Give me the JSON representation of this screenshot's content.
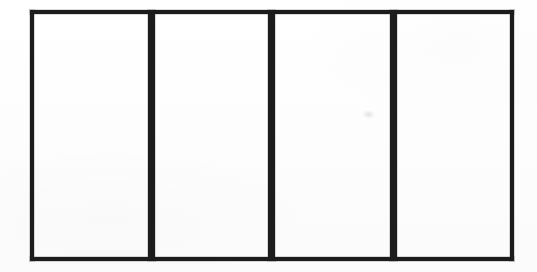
{
  "figure": {
    "kind": "line-drawing",
    "caption": "",
    "width": 537,
    "height": 272,
    "background_color": "#fefefe",
    "ink_color": "#1c1c1c"
  },
  "outline": {
    "label": "outer-rectangle",
    "left": 30,
    "top": 10,
    "right": 514,
    "bottom": 261,
    "width": 484,
    "height": 251,
    "stroke_width": 4
  },
  "dividers": [
    {
      "label": "divider-1",
      "x": 148,
      "width": 7
    },
    {
      "label": "divider-2",
      "x": 268,
      "width": 7
    },
    {
      "label": "divider-3",
      "x": 390,
      "width": 7
    }
  ],
  "cells": [
    {
      "label": "panel-1",
      "left": 34,
      "width": 114,
      "text": ""
    },
    {
      "label": "panel-2",
      "left": 155,
      "width": 113,
      "text": ""
    },
    {
      "label": "panel-3",
      "left": 275,
      "width": 115,
      "text": ""
    },
    {
      "label": "panel-4",
      "left": 397,
      "width": 113,
      "text": ""
    }
  ],
  "artifacts": [
    {
      "label": "scan-smudge",
      "x": 362,
      "y": 110
    }
  ]
}
